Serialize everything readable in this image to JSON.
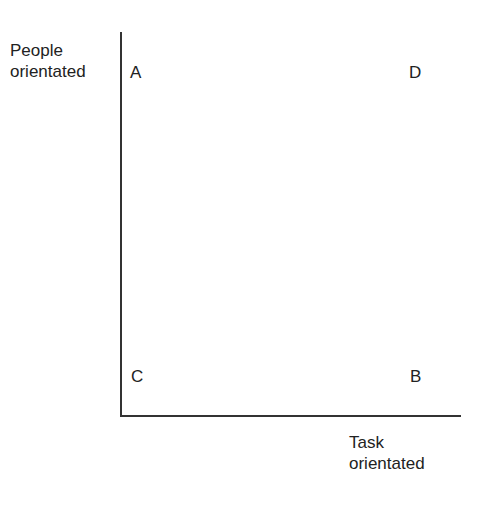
{
  "diagram": {
    "y_axis_label": [
      "People",
      "orientated"
    ],
    "x_axis_label": [
      "Task",
      "orientated"
    ],
    "quadrants": {
      "top_left": "A",
      "top_right": "D",
      "bottom_left": "C",
      "bottom_right": "B"
    }
  }
}
